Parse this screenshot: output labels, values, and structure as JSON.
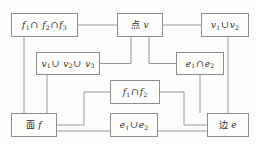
{
  "diagram": {
    "type": "flowchart",
    "title": "",
    "background_color": "#fdfdfc",
    "line_color": "#8d8d8d",
    "text_color": "#2b2b2b",
    "nodes": [
      {
        "id": "f1f2f3",
        "label": "f₁∩ f₂∩f₃",
        "parts": [
          {
            "t": "f",
            "style": "ital"
          },
          {
            "t": "1",
            "style": "sub"
          },
          {
            "t": "∩",
            "style": "op"
          },
          {
            "t": " ",
            "style": "plain"
          },
          {
            "t": "f",
            "style": "ital"
          },
          {
            "t": "2",
            "style": "sub"
          },
          {
            "t": "∩",
            "style": "op"
          },
          {
            "t": "f",
            "style": "ital"
          },
          {
            "t": "3",
            "style": "sub"
          }
        ],
        "x": 11,
        "y": 13,
        "w": 67,
        "h": 24
      },
      {
        "id": "point_v",
        "label": "点 v",
        "parts": [
          {
            "t": "点",
            "style": "cjk"
          },
          {
            "t": " ",
            "style": "plain"
          },
          {
            "t": "v",
            "style": "ital"
          }
        ],
        "x": 117,
        "y": 13,
        "w": 46,
        "h": 24
      },
      {
        "id": "v1v2",
        "label": "v₁∪v₂",
        "parts": [
          {
            "t": "v",
            "style": "ital"
          },
          {
            "t": "1",
            "style": "sub"
          },
          {
            "t": "∪",
            "style": "op"
          },
          {
            "t": "v",
            "style": "ital"
          },
          {
            "t": "2",
            "style": "sub"
          }
        ],
        "x": 201,
        "y": 13,
        "w": 48,
        "h": 24
      },
      {
        "id": "v1v2v3",
        "label": "v₁∪ v₂∪ v₃",
        "parts": [
          {
            "t": "v",
            "style": "ital"
          },
          {
            "t": "1",
            "style": "sub"
          },
          {
            "t": "∪",
            "style": "op"
          },
          {
            "t": " ",
            "style": "plain"
          },
          {
            "t": "v",
            "style": "ital"
          },
          {
            "t": "2",
            "style": "sub"
          },
          {
            "t": "∪",
            "style": "op"
          },
          {
            "t": " ",
            "style": "plain"
          },
          {
            "t": "v",
            "style": "ital"
          },
          {
            "t": "3",
            "style": "sub"
          }
        ],
        "x": 36,
        "y": 52,
        "w": 64,
        "h": 23
      },
      {
        "id": "e1e2_int",
        "label": "e₁∩e₂",
        "parts": [
          {
            "t": "e",
            "style": "ital"
          },
          {
            "t": "1",
            "style": "sub"
          },
          {
            "t": "∩",
            "style": "op"
          },
          {
            "t": "e",
            "style": "ital"
          },
          {
            "t": "2",
            "style": "sub"
          }
        ],
        "x": 176,
        "y": 52,
        "w": 48,
        "h": 23
      },
      {
        "id": "f1f2",
        "label": "f₁∩f₂",
        "parts": [
          {
            "t": "f",
            "style": "ital"
          },
          {
            "t": "1",
            "style": "sub"
          },
          {
            "t": "∩",
            "style": "op"
          },
          {
            "t": "f",
            "style": "ital"
          },
          {
            "t": "2",
            "style": "sub"
          }
        ],
        "x": 110,
        "y": 80,
        "w": 50,
        "h": 24
      },
      {
        "id": "face_f",
        "label": "面 f",
        "parts": [
          {
            "t": "面",
            "style": "cjk"
          },
          {
            "t": " ",
            "style": "plain"
          },
          {
            "t": "f",
            "style": "ital"
          }
        ],
        "x": 11,
        "y": 113,
        "w": 46,
        "h": 24
      },
      {
        "id": "e1e2_uni",
        "label": "e₁∪e₂",
        "parts": [
          {
            "t": "e",
            "style": "ital"
          },
          {
            "t": "1",
            "style": "sub"
          },
          {
            "t": "∪",
            "style": "op"
          },
          {
            "t": "e",
            "style": "ital"
          },
          {
            "t": "2",
            "style": "sub"
          }
        ],
        "x": 110,
        "y": 113,
        "w": 48,
        "h": 24
      },
      {
        "id": "edge_e",
        "label": "边 e",
        "parts": [
          {
            "t": "边",
            "style": "cjk"
          },
          {
            "t": " ",
            "style": "plain"
          },
          {
            "t": "e",
            "style": "ital"
          }
        ],
        "x": 207,
        "y": 113,
        "w": 42,
        "h": 24
      }
    ],
    "edges": [
      {
        "from": "f1f2f3",
        "to": "point_v",
        "path": "M78,25 L117,25"
      },
      {
        "from": "point_v",
        "to": "v1v2",
        "path": "M163,25 L201,25"
      },
      {
        "from": "point_v",
        "to": "v1v2v3",
        "path": "M131,37 L131,63.5 L100,63.5"
      },
      {
        "from": "point_v",
        "to": "e1e2_int",
        "path": "M149,37 L149,63.5 L176,63.5"
      },
      {
        "from": "f1f2f3",
        "to": "face_f",
        "path": "M24,37 L24,113"
      },
      {
        "from": "v1v2v3",
        "to": "face_f",
        "path": "M47,75 L47,113"
      },
      {
        "from": "f1f2",
        "to": "face_f",
        "path": "M110,92 L84,92 L84,125 L57,125"
      },
      {
        "from": "f1f2",
        "to": "edge_e",
        "path": "M160,92 L184,92 L184,125 L207,125"
      },
      {
        "from": "face_f",
        "to": "e1e2_uni",
        "path": "M57,131 L110,131"
      },
      {
        "from": "e1e2_uni",
        "to": "edge_e",
        "path": "M158,131 L207,131"
      },
      {
        "from": "v1v2",
        "to": "edge_e",
        "path": "M228,37 L228,113"
      },
      {
        "from": "e1e2_int",
        "to": "edge_e",
        "path": "M200,75 L200,113"
      }
    ]
  }
}
